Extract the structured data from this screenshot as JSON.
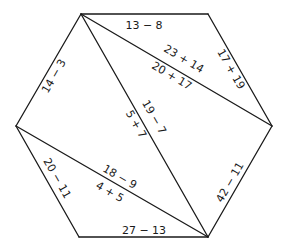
{
  "diagram": {
    "type": "hexagon-triangulation",
    "vertices": {
      "A": [
        81,
        14
      ],
      "B": [
        208,
        14
      ],
      "C": [
        272,
        126
      ],
      "D": [
        208,
        237
      ],
      "E": [
        79,
        237
      ],
      "F": [
        16,
        126
      ]
    },
    "sides": [
      {
        "from": "A",
        "to": "B",
        "label": "13 − 8"
      },
      {
        "from": "B",
        "to": "C",
        "label": "17 + 19"
      },
      {
        "from": "C",
        "to": "D",
        "label": "42 − 11"
      },
      {
        "from": "D",
        "to": "E",
        "label": "27 − 13"
      },
      {
        "from": "E",
        "to": "F",
        "label": "20 − 11"
      },
      {
        "from": "F",
        "to": "A",
        "label": "14 − 3"
      }
    ],
    "diagonals": [
      {
        "from": "A",
        "to": "C",
        "label_above": "23 + 14",
        "label_below": "20 + 17"
      },
      {
        "from": "A",
        "to": "D",
        "label_right": "19 − 7",
        "label_left": "5 + 7"
      },
      {
        "from": "F",
        "to": "D",
        "label_above": "18 − 9",
        "label_below": "4 + 5"
      }
    ]
  }
}
